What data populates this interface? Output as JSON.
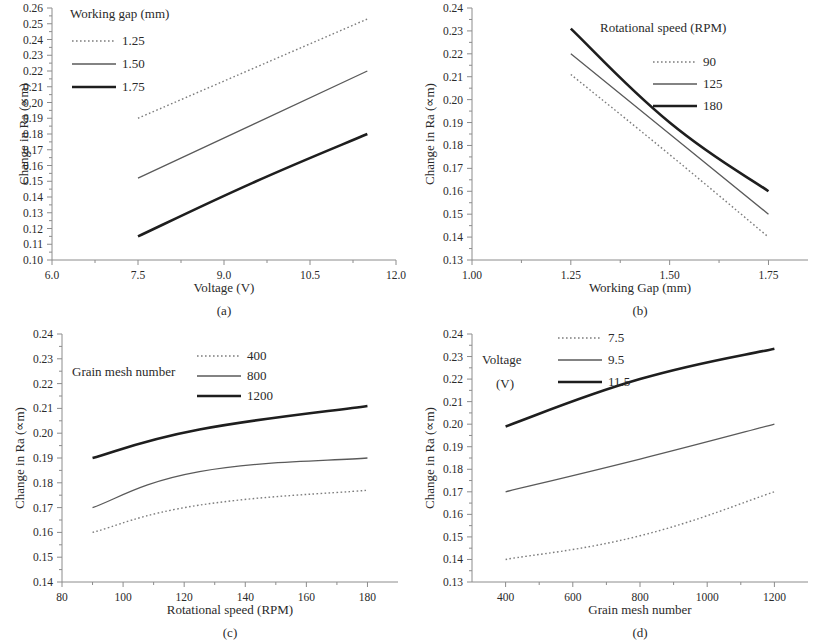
{
  "figure": {
    "ylabel_common": "Change in Ra (∝m)",
    "captions": {
      "a": "(a)",
      "b": "(b)",
      "c": "(c)",
      "d": "(d)"
    }
  },
  "chart_data": [
    {
      "panel": "a",
      "type": "line",
      "title": "",
      "xlabel": "Voltage (V)",
      "ylabel": "Change in Ra (∝m)",
      "legend_title": "Working gap (mm)",
      "legend_position": "top-left-inside",
      "grid": false,
      "xlim": [
        6.0,
        12.0
      ],
      "ylim": [
        0.1,
        0.26
      ],
      "xticks": [
        6.0,
        7.5,
        9.0,
        10.5,
        12.0
      ],
      "xtick_labels": [
        "6.0",
        "7.5",
        "9.0",
        "10.5",
        "12.0"
      ],
      "yticks": [
        0.1,
        0.11,
        0.12,
        0.13,
        0.14,
        0.15,
        0.16,
        0.17,
        0.18,
        0.19,
        0.2,
        0.21,
        0.22,
        0.23,
        0.24,
        0.25,
        0.26
      ],
      "ytick_labels": [
        "0.10",
        "0.11",
        "0.12",
        "0.13",
        "0.14",
        "0.15",
        "0.16",
        "0.17",
        "0.18",
        "0.19",
        "0.20",
        "0.21",
        "0.22",
        "0.23",
        "0.24",
        "0.25",
        "0.26"
      ],
      "x": [
        7.5,
        9.5,
        11.5
      ],
      "series": [
        {
          "name": "1.25",
          "style": "dotted",
          "values": [
            0.19,
            0.2215,
            0.253
          ]
        },
        {
          "name": "1.50",
          "style": "thin",
          "values": [
            0.152,
            0.186,
            0.22
          ]
        },
        {
          "name": "1.75",
          "style": "thick",
          "values": [
            0.115,
            0.149,
            0.18
          ]
        }
      ]
    },
    {
      "panel": "b",
      "type": "line",
      "title": "",
      "xlabel": "Working Gap (mm)",
      "ylabel": "Change in Ra (∝m)",
      "legend_title": "Rotational speed (RPM)",
      "legend_position": "top-right-inside",
      "grid": false,
      "xlim": [
        1.0,
        1.85
      ],
      "ylim": [
        0.13,
        0.24
      ],
      "xticks": [
        1.0,
        1.25,
        1.5,
        1.75
      ],
      "xtick_labels": [
        "1.00",
        "1.25",
        "1.50",
        "1.75"
      ],
      "yticks": [
        0.13,
        0.14,
        0.15,
        0.16,
        0.17,
        0.18,
        0.19,
        0.2,
        0.21,
        0.22,
        0.23,
        0.24
      ],
      "ytick_labels": [
        "0.13",
        "0.14",
        "0.15",
        "0.16",
        "0.17",
        "0.18",
        "0.19",
        "0.20",
        "0.21",
        "0.22",
        "0.23",
        "0.24"
      ],
      "x": [
        1.25,
        1.5,
        1.75
      ],
      "series": [
        {
          "name": "90",
          "style": "dotted",
          "values": [
            0.211,
            0.176,
            0.14
          ]
        },
        {
          "name": "125",
          "style": "thin",
          "values": [
            0.22,
            0.185,
            0.15
          ]
        },
        {
          "name": "180",
          "style": "thick",
          "values": [
            0.231,
            0.19,
            0.16
          ]
        }
      ]
    },
    {
      "panel": "c",
      "type": "line",
      "title": "",
      "xlabel": "Rotational speed (RPM)",
      "ylabel": "Change in Ra (∝m)",
      "legend_title": "Grain mesh number",
      "legend_position": "top-center-inside",
      "grid": false,
      "xlim": [
        80,
        190
      ],
      "ylim": [
        0.14,
        0.24
      ],
      "xticks": [
        80,
        100,
        120,
        140,
        160,
        180
      ],
      "xtick_labels": [
        "80",
        "100",
        "120",
        "140",
        "160",
        "180"
      ],
      "yticks": [
        0.14,
        0.15,
        0.16,
        0.17,
        0.18,
        0.19,
        0.2,
        0.21,
        0.22,
        0.23,
        0.24
      ],
      "ytick_labels": [
        "0.14",
        "0.15",
        "0.16",
        "0.17",
        "0.18",
        "0.19",
        "0.20",
        "0.21",
        "0.22",
        "0.23",
        "0.24"
      ],
      "x": [
        90,
        125,
        180
      ],
      "series": [
        {
          "name": "400",
          "style": "dotted",
          "values": [
            0.16,
            0.171,
            0.177
          ]
        },
        {
          "name": "800",
          "style": "thin",
          "values": [
            0.17,
            0.1845,
            0.19
          ]
        },
        {
          "name": "1200",
          "style": "thick",
          "values": [
            0.19,
            0.2015,
            0.211
          ]
        }
      ]
    },
    {
      "panel": "d",
      "type": "line",
      "title": "",
      "xlabel": "Grain mesh number",
      "ylabel": "Change in Ra (∝m)",
      "legend_title": "Voltage",
      "legend_title_line2": "(V)",
      "legend_position": "top-left-inside",
      "grid": false,
      "xlim": [
        300,
        1300
      ],
      "ylim": [
        0.13,
        0.24
      ],
      "xticks": [
        400,
        600,
        800,
        1000,
        1200
      ],
      "xtick_labels": [
        "400",
        "600",
        "800",
        "1000",
        "1200"
      ],
      "yticks": [
        0.13,
        0.14,
        0.15,
        0.16,
        0.17,
        0.18,
        0.19,
        0.2,
        0.21,
        0.22,
        0.23,
        0.24
      ],
      "ytick_labels": [
        "0.13",
        "0.14",
        "0.15",
        "0.16",
        "0.17",
        "0.18",
        "0.19",
        "0.20",
        "0.21",
        "0.22",
        "0.23",
        "0.24"
      ],
      "x": [
        400,
        800,
        1200
      ],
      "series": [
        {
          "name": "7.5",
          "style": "dotted",
          "values": [
            0.14,
            0.1505,
            0.17
          ]
        },
        {
          "name": "9.5",
          "style": "thin",
          "values": [
            0.17,
            0.1845,
            0.2
          ]
        },
        {
          "name": "11.5",
          "style": "thick",
          "values": [
            0.199,
            0.22,
            0.2335
          ]
        }
      ]
    }
  ]
}
